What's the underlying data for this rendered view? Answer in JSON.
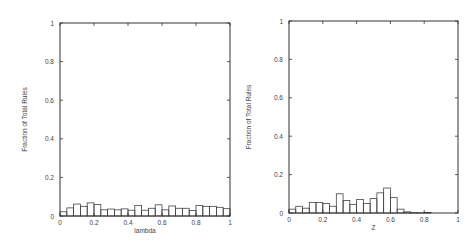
{
  "chart_data": [
    {
      "type": "bar",
      "title": "",
      "xlabel": "lambda",
      "ylabel": "Fraction of Total Rules",
      "xlim": [
        0,
        1
      ],
      "ylim": [
        0,
        1
      ],
      "xticks": [
        "0",
        "0.2",
        "0.4",
        "0.6",
        "0.8",
        "1"
      ],
      "yticks": [
        "0",
        "0.2",
        "0.4",
        "0.6",
        "0.8",
        "1"
      ],
      "grid": false,
      "legend": null,
      "bin_width": 0.04,
      "bin_starts": [
        0,
        0.04,
        0.08,
        0.12,
        0.16,
        0.2,
        0.24,
        0.28,
        0.32,
        0.36,
        0.4,
        0.44,
        0.48,
        0.52,
        0.56,
        0.6,
        0.64,
        0.68,
        0.72,
        0.76,
        0.8,
        0.84,
        0.88,
        0.92,
        0.96
      ],
      "values": [
        0.022,
        0.042,
        0.062,
        0.05,
        0.068,
        0.06,
        0.032,
        0.036,
        0.032,
        0.037,
        0.03,
        0.055,
        0.03,
        0.04,
        0.058,
        0.032,
        0.052,
        0.04,
        0.04,
        0.028,
        0.055,
        0.05,
        0.05,
        0.045,
        0.038
      ]
    },
    {
      "type": "bar",
      "title": "",
      "xlabel": "Z",
      "ylabel": "Fraction of Total Rules",
      "xlim": [
        0,
        1
      ],
      "ylim": [
        0,
        1
      ],
      "xticks": [
        "0",
        "0.2",
        "0.4",
        "0.6",
        "0.8",
        "1"
      ],
      "yticks": [
        "0",
        "0.2",
        "0.4",
        "0.6",
        "0.8",
        "1"
      ],
      "grid": false,
      "legend": null,
      "bin_width": 0.04,
      "bin_starts": [
        0,
        0.04,
        0.08,
        0.12,
        0.16,
        0.2,
        0.24,
        0.28,
        0.32,
        0.36,
        0.4,
        0.44,
        0.48,
        0.52,
        0.56,
        0.6,
        0.64,
        0.68,
        0.72,
        0.76,
        0.8,
        0.84,
        0.88,
        0.92,
        0.96
      ],
      "values": [
        0.02,
        0.035,
        0.025,
        0.055,
        0.055,
        0.05,
        0.035,
        0.1,
        0.065,
        0.045,
        0.07,
        0.05,
        0.075,
        0.105,
        0.13,
        0.08,
        0.02,
        0.006,
        0.002,
        0.001,
        0.003,
        0,
        0,
        0,
        0
      ]
    }
  ]
}
